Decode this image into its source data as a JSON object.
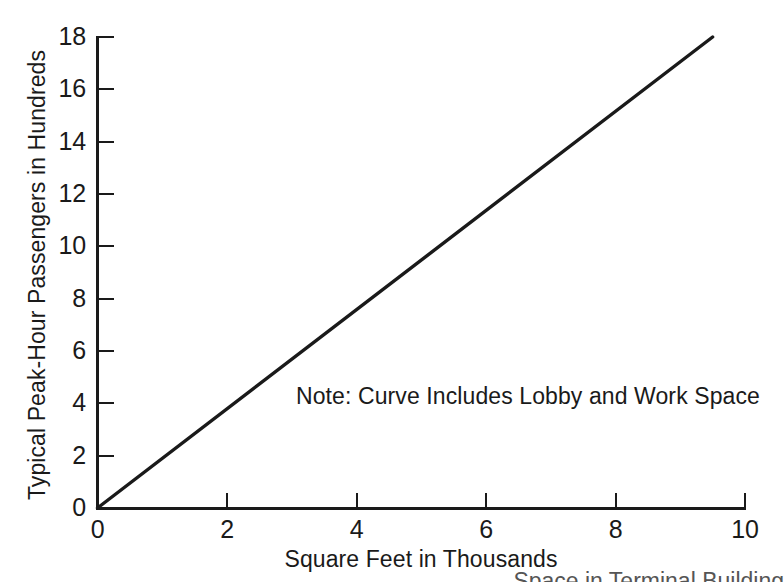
{
  "chart_data": {
    "type": "line",
    "title": "",
    "xlabel": "Square Feet in Thousands",
    "ylabel": "Typical Peak-Hour Passengers in Hundreds",
    "xlim": [
      0,
      10
    ],
    "ylim": [
      0,
      18
    ],
    "xticks": [
      0,
      2,
      4,
      6,
      8,
      10
    ],
    "yticks": [
      0,
      2,
      4,
      6,
      8,
      10,
      12,
      14,
      16,
      18
    ],
    "xtick_labels": [
      "0",
      "2",
      "4",
      "6",
      "8",
      "10"
    ],
    "ytick_labels": [
      "0",
      "2",
      "4",
      "6",
      "8",
      "10",
      "12",
      "14",
      "16",
      "18"
    ],
    "grid": false,
    "legend": "none",
    "annotations": [
      {
        "name": "curve-note",
        "text": "Note: Curve Includes Lobby and Work Space",
        "x": 4.0,
        "y": 4.5
      }
    ],
    "series": [
      {
        "name": "Typical Peak-Hour Passengers",
        "x": [
          0,
          9.5
        ],
        "values": [
          0,
          18
        ],
        "style": "solid",
        "color": "#1a1a1a"
      }
    ]
  },
  "axes": {
    "y": {
      "title": "Typical Peak-Hour Passengers in Hundreds",
      "ticks": [
        {
          "label": "18",
          "value": 18
        },
        {
          "label": "16",
          "value": 16
        },
        {
          "label": "14",
          "value": 14
        },
        {
          "label": "12",
          "value": 12
        },
        {
          "label": "10",
          "value": 10
        },
        {
          "label": "8",
          "value": 8
        },
        {
          "label": "6",
          "value": 6
        },
        {
          "label": "4",
          "value": 4
        },
        {
          "label": "2",
          "value": 2
        },
        {
          "label": "0",
          "value": 0
        }
      ]
    },
    "x": {
      "title": "Square Feet in Thousands",
      "ticks": [
        {
          "label": "0",
          "value": 0
        },
        {
          "label": "2",
          "value": 2
        },
        {
          "label": "4",
          "value": 4
        },
        {
          "label": "6",
          "value": 6
        },
        {
          "label": "8",
          "value": 8
        },
        {
          "label": "10",
          "value": 10
        }
      ]
    }
  },
  "note": {
    "text": "Note: Curve Includes Lobby and Work Space"
  },
  "caption": {
    "text": "Space in Terminal Building"
  },
  "colors": {
    "line": "#1a1a1a",
    "axis": "#1a1a1a",
    "text": "#1a1a1a",
    "background": "#ffffff"
  }
}
